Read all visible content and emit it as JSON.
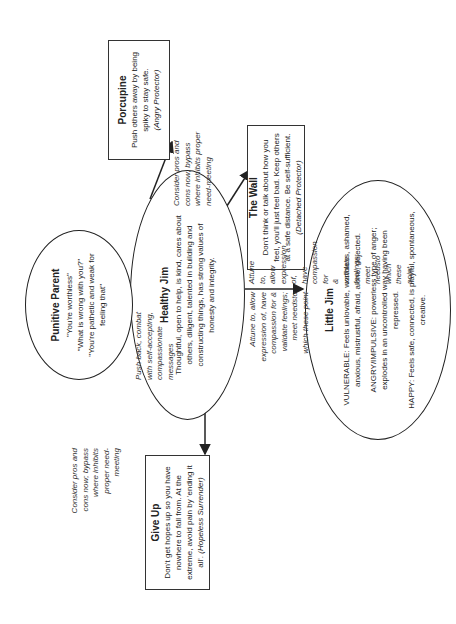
{
  "diagram": {
    "orientation": "rotated 90 degrees counter-clockwise",
    "nodes": {
      "healthy_jim": {
        "title": "Healthy Jim",
        "text": "Thoughtful, open to help, is kind, cares about others, diligent, talented in building and constructing things, has strong values of honesty and integrity."
      },
      "little_jim": {
        "title": "Little Jim",
        "vulnerable": "VULNERABLE: Feels unlovable, worthless, ashamed, anxious, mistrustful, afraid, alone, dejected.",
        "angry": "ANGRY/IMPULSIVE: powerless type of anger; explodes in an uncontrolled way having been repressed.",
        "happy": "HAPPY: Feels safe, connected, is playful, spontaneous, creative."
      },
      "punitive_parent": {
        "title": "Punitive Parent",
        "quote1": "\"You're worthless\"",
        "quote2": "\"What is wrong with you?\"",
        "quote3": "\"You're pathetic and weak for feeling that\""
      },
      "porcupine": {
        "title": "Porcupine",
        "text": "Push others away by being spiky to stay safe.",
        "mode": "(Angry Protector)"
      },
      "the_wall": {
        "title": "The Wall",
        "text": "Don't think or talk about how you feel, you'll just feel bad. Keep others at a safe distance. Be self-sufficient.",
        "mode": "(Detached Protector)"
      },
      "give_up": {
        "title": "Give Up",
        "text": "Don't get hopes up so you have nowhere to fall from. At the extreme, avoid pain by 'ending it all'.",
        "mode": "(Hopeless Surrender)"
      }
    },
    "edge_labels": {
      "to_punitive_parent": "Push back, combat with self-accepting, compassionate messages",
      "to_porcupine": "Consider pros and cons now; bypass where inhibits proper need-meeting",
      "to_give_up": "Consider pros and cons now; bypass where inhibits proper need-meeting",
      "to_little_jim": "Attune to, allow expression of, have compassion for & validate feelings; meet needsto which these point"
    },
    "colors": {
      "line": "#222222",
      "background": "#ffffff"
    }
  }
}
